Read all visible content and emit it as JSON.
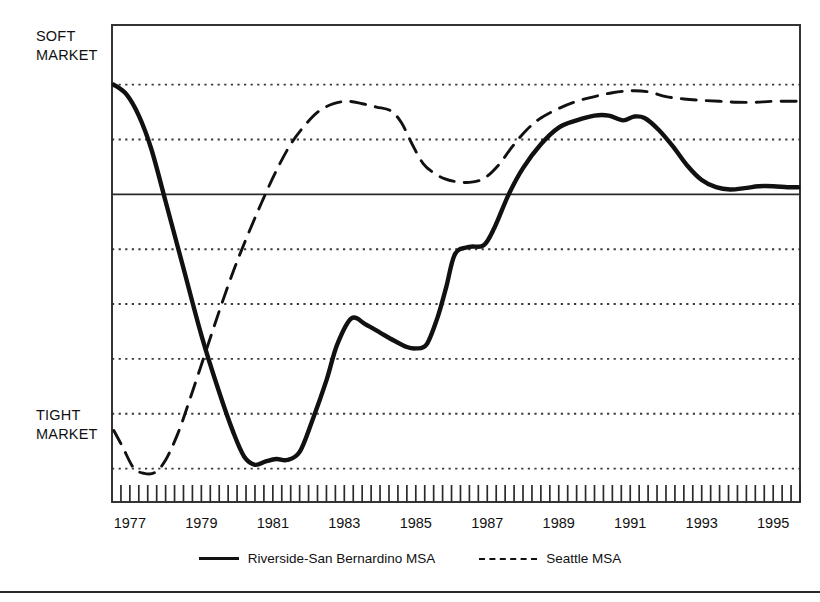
{
  "axis_labels": {
    "top_left_line1": "SOFT",
    "top_left_line2": "MARKET",
    "bottom_left_line1": "TIGHT",
    "bottom_left_line2": "MARKET"
  },
  "legend": {
    "series1_label": "Riverside-San Bernardino MSA",
    "series2_label": "Seattle MSA"
  },
  "colors": {
    "line": "#111111",
    "frame": "#2a2a2a",
    "grid": "#3a3a3a",
    "background": "#ffffff"
  },
  "chart_data": {
    "type": "line",
    "title": "",
    "subtitle": "",
    "xlabel": "",
    "ylabel": "",
    "grid": true,
    "legend_position": "bottom-center",
    "xlim": [
      1976.5,
      1995.75
    ],
    "ylim": [
      0,
      10
    ],
    "y_axis_description": "Unlabeled index; higher = softer market, lower = tighter market",
    "y_annotations": [
      {
        "text": "SOFT MARKET",
        "position": "top"
      },
      {
        "text": "TIGHT MARKET",
        "position": "bottom"
      }
    ],
    "y_gridlines": [
      8.75,
      7.6,
      6.45,
      5.3,
      4.15,
      3.0,
      1.85,
      0.7
    ],
    "y_reference_line": 6.45,
    "x_tick_labels": [
      "1977",
      "1979",
      "1981",
      "1983",
      "1985",
      "1987",
      "1989",
      "1991",
      "1993",
      "1995"
    ],
    "x_tick_values": [
      1977,
      1979,
      1981,
      1983,
      1985,
      1987,
      1989,
      1991,
      1993,
      1995
    ],
    "x_minor_tick_interval": 0.25,
    "series": [
      {
        "name": "Riverside-San Bernardino MSA",
        "style": "solid",
        "x": [
          1976.55,
          1976.9,
          1977.25,
          1977.6,
          1978.0,
          1978.5,
          1979.0,
          1979.5,
          1979.9,
          1980.2,
          1980.5,
          1980.8,
          1981.1,
          1981.4,
          1981.75,
          1982.1,
          1982.5,
          1982.8,
          1983.2,
          1983.6,
          1984.0,
          1984.4,
          1984.75,
          1985.0,
          1985.3,
          1985.6,
          1985.85,
          1986.1,
          1986.5,
          1986.9,
          1987.2,
          1987.6,
          1988.0,
          1988.5,
          1989.0,
          1989.5,
          1990.0,
          1990.4,
          1990.8,
          1991.1,
          1991.4,
          1991.8,
          1992.2,
          1992.6,
          1993.0,
          1993.4,
          1993.8,
          1994.2,
          1994.6,
          1995.0,
          1995.4,
          1995.7
        ],
        "y": [
          8.75,
          8.55,
          8.1,
          7.4,
          6.3,
          4.9,
          3.5,
          2.3,
          1.45,
          0.95,
          0.78,
          0.85,
          0.9,
          0.88,
          1.05,
          1.7,
          2.55,
          3.3,
          3.85,
          3.72,
          3.55,
          3.38,
          3.25,
          3.22,
          3.3,
          3.85,
          4.5,
          5.2,
          5.35,
          5.38,
          5.75,
          6.45,
          7.0,
          7.5,
          7.85,
          8.0,
          8.1,
          8.1,
          8.0,
          8.08,
          8.05,
          7.8,
          7.45,
          7.05,
          6.75,
          6.6,
          6.55,
          6.58,
          6.62,
          6.62,
          6.6,
          6.6
        ]
      },
      {
        "name": "Seattle MSA",
        "style": "dashed",
        "x": [
          1976.55,
          1976.8,
          1977.1,
          1977.4,
          1977.7,
          1978.0,
          1978.35,
          1978.7,
          1979.1,
          1979.5,
          1979.9,
          1980.3,
          1980.7,
          1981.1,
          1981.5,
          1981.9,
          1982.3,
          1982.7,
          1983.1,
          1983.5,
          1983.9,
          1984.3,
          1984.6,
          1984.9,
          1985.2,
          1985.5,
          1985.8,
          1986.1,
          1986.5,
          1986.9,
          1987.3,
          1987.7,
          1988.1,
          1988.5,
          1989.0,
          1989.5,
          1990.0,
          1990.5,
          1991.0,
          1991.5,
          1992.0,
          1992.5,
          1993.0,
          1993.5,
          1994.0,
          1994.5,
          1995.0,
          1995.7
        ],
        "y": [
          1.5,
          1.15,
          0.72,
          0.6,
          0.62,
          0.88,
          1.45,
          2.2,
          3.1,
          4.0,
          4.85,
          5.6,
          6.3,
          6.95,
          7.5,
          7.9,
          8.2,
          8.35,
          8.4,
          8.35,
          8.28,
          8.2,
          7.95,
          7.5,
          7.1,
          6.9,
          6.78,
          6.72,
          6.7,
          6.78,
          7.05,
          7.45,
          7.8,
          8.05,
          8.25,
          8.4,
          8.5,
          8.58,
          8.62,
          8.6,
          8.5,
          8.45,
          8.42,
          8.4,
          8.38,
          8.38,
          8.4,
          8.4
        ]
      }
    ]
  }
}
